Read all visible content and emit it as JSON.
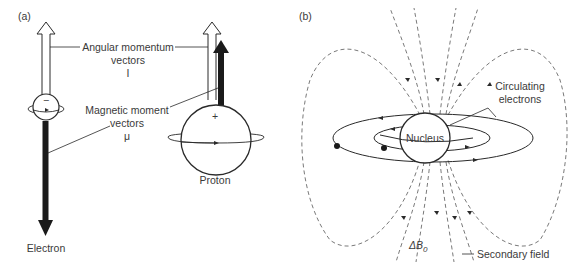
{
  "panel_a": {
    "label": "(a)",
    "angular_momentum": {
      "line1": "Angular momentum",
      "line2": "vectors",
      "symbol": "I"
    },
    "magnetic_moment": {
      "line1": "Magnetic moment",
      "line2": "vectors",
      "symbol": "μ"
    },
    "electron": {
      "label": "Electron",
      "charge": "−"
    },
    "proton": {
      "label": "Proton",
      "charge": "+"
    }
  },
  "panel_b": {
    "label": "(b)",
    "nucleus": "Nucleus",
    "circulating": {
      "line1": "Circulating",
      "line2": "electrons"
    },
    "delta_b": "ΔB",
    "delta_b_sub": "0",
    "secondary_field": "Secondary field"
  },
  "colors": {
    "stroke": "#2a2a2a",
    "dash": "#6a6a6a",
    "text": "#3a3a3a"
  }
}
